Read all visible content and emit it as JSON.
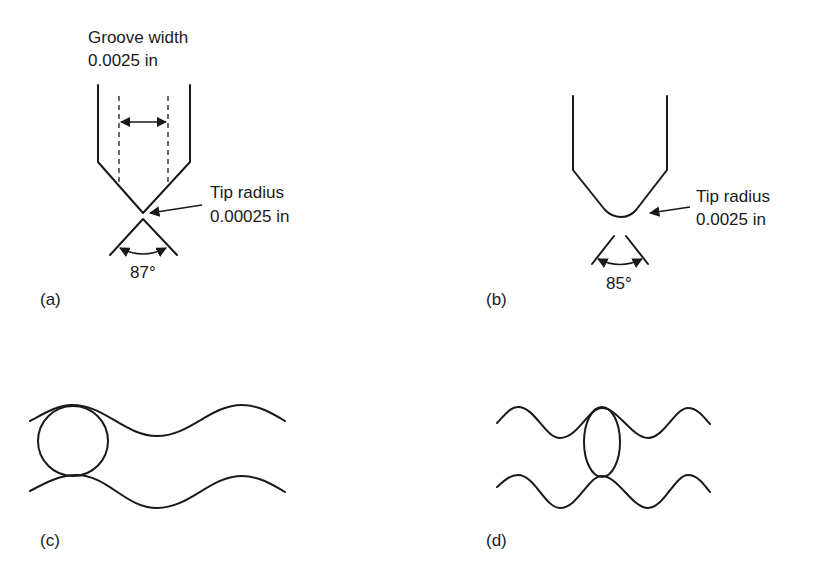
{
  "panels": {
    "a": {
      "label": "(a)",
      "groove_width_title": "Groove width",
      "groove_width_value": "0.0025 in",
      "tip_radius_title": "Tip radius",
      "tip_radius_value": "0.00025 in",
      "angle": "87°"
    },
    "b": {
      "label": "(b)",
      "tip_radius_title": "Tip radius",
      "tip_radius_value": "0.0025 in",
      "angle": "85°"
    },
    "c": {
      "label": "(c)"
    },
    "d": {
      "label": "(d)"
    }
  },
  "colors": {
    "ink": "#1a1a1a",
    "background": "#ffffff"
  }
}
